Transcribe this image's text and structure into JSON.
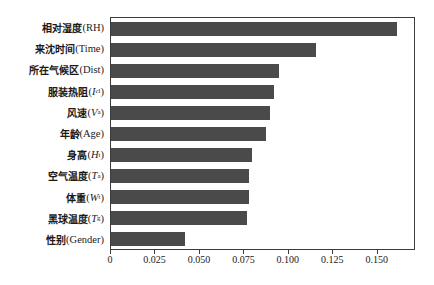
{
  "chart_data": {
    "type": "bar",
    "orientation": "horizontal",
    "title": "",
    "xlabel": "",
    "ylabel": "",
    "xlim": [
      0,
      0.1715
    ],
    "grid": false,
    "legend": null,
    "bar_color": "#4a4a4a",
    "frame_color": "#3c3c3c",
    "xticks": [
      0,
      0.025,
      0.05,
      0.075,
      0.1,
      0.125,
      0.15
    ],
    "xticklabels": [
      "0",
      "0.025",
      "0.050",
      "0.075",
      "0.100",
      "0.125",
      "0.150"
    ],
    "categories": [
      "相对湿度 (RH)",
      "来沈时间 (Time)",
      "所在气候区 (Dist)",
      "服装热阻 (Icl)",
      "风速 (Va)",
      "年龄 (Age)",
      "身高 (Ht)",
      "空气温度 (Ta)",
      "体重 (Wt)",
      "黑球温度 (Tg)",
      "性别 (Gender)"
    ],
    "values": [
      0.162,
      0.116,
      0.095,
      0.092,
      0.09,
      0.088,
      0.08,
      0.078,
      0.078,
      0.077,
      0.042
    ]
  },
  "labels": [
    {
      "cn": "相对湿度",
      "open": " (",
      "sym": "RH",
      "sub": "",
      "close": ")"
    },
    {
      "cn": "来沈时间",
      "open": " (",
      "sym": "Time",
      "sub": "",
      "close": ")"
    },
    {
      "cn": "所在气候区",
      "open": " (",
      "sym": "Dist",
      "sub": "",
      "close": ")"
    },
    {
      "cn": "服装热阻",
      "open": " (",
      "sym": "I",
      "sub": "cl",
      "close": ")"
    },
    {
      "cn": "风速",
      "open": " (",
      "sym": "V",
      "sub": "a",
      "close": ")"
    },
    {
      "cn": "年龄",
      "open": " (",
      "sym": "Age",
      "sub": "",
      "close": ")"
    },
    {
      "cn": "身高",
      "open": " (",
      "sym": "H",
      "sub": "t",
      "close": ")"
    },
    {
      "cn": "空气温度",
      "open": " (",
      "sym": "T",
      "sub": "a",
      "close": ")"
    },
    {
      "cn": "体重",
      "open": " (",
      "sym": "W",
      "sub": "t",
      "close": ")"
    },
    {
      "cn": "黑球温度",
      "open": " (",
      "sym": "T",
      "sub": "g",
      "close": ")"
    },
    {
      "cn": "性别",
      "open": " (",
      "sym": "Gender",
      "sub": "",
      "close": ")"
    }
  ]
}
